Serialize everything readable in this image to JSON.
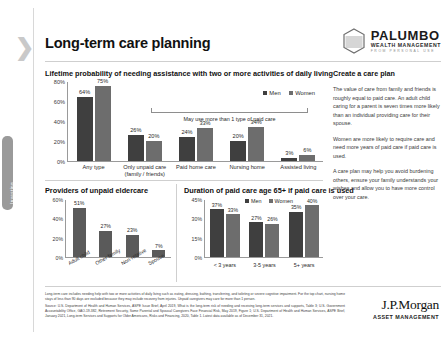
{
  "side_tab": {
    "label": "Investing"
  },
  "header": {
    "title": "Long-term care planning",
    "logo": {
      "name": "PALUMBO",
      "sub": "WEALTH MANAGEMENT",
      "tagline": "FROM PERSONAL USE"
    }
  },
  "top_chart_heading": "Lifetime probability of needing assistance with two or more activities of daily living",
  "bottom_left_heading": "Providers of unpaid eldercare",
  "bottom_right_heading": "Duration of paid care age 65+ if paid care is used",
  "brace_note": "May use more than 1 type of paid care",
  "legend": {
    "men": "Men",
    "women": "Women"
  },
  "sidebar": {
    "heading": "Create a care plan",
    "paragraphs": [
      "The value of care from family and friends is roughly equal to paid care. An adult child caring for a parent is seven times more likely than an individual providing care for their spouse.",
      "Women are more likely to require care and need more years of paid care if paid care is used.",
      "A care plan may help you avoid burdening others, ensure your family understands your wishes and allow you to have more control over your care."
    ]
  },
  "footnotes": [
    "Long-term care includes needing help with two or more activities of daily living such as eating, dressing, bathing, transferring, and toileting or severe cognitive impairment. For the top chart, nursing home stays of less than 90 days are excluded because they may include recovery from injuries. Unpaid caregivers may care for more than 1 person.",
    "Source: U.S. Department of Health and Human Services, ASPE Issue Brief, April 2019, What is the long-term risk of needing and receiving long-term services and supports, Table 3; U.S. Government Accountability Office, GAO-19-382, Retirement Security, Some Parental and Spousal Caregivers Face Financial Risk, May 2019, Figure 1; U.S. Department of Health and Human Services, ASPE Brief, January 2021, Long-term Services and Supports for Older Americans, Risks and Financing, 2020, Table 1. Latest data available as of December 31, 2021."
  ],
  "jpm_logo": {
    "name": "J.P.Morgan",
    "sub": "ASSET MANAGEMENT"
  },
  "chart_data": [
    {
      "type": "bar",
      "id": "lifetime-probability",
      "title": "Lifetime probability of needing assistance with two or more activities of daily living",
      "categories": [
        "Any type",
        "Only unpaid care (family / friends)",
        "Paid home care",
        "Nursing home",
        "Assisted living"
      ],
      "series": [
        {
          "name": "Men",
          "values": [
            64,
            26,
            24,
            20,
            3
          ]
        },
        {
          "name": "Women",
          "values": [
            75,
            20,
            33,
            34,
            6
          ]
        }
      ],
      "ytick_labels": [
        "0%",
        "20%",
        "40%",
        "60%",
        "80%"
      ],
      "ylim": [
        0,
        80
      ],
      "xlabel": "",
      "ylabel": "",
      "grid": false,
      "legend_position": "top-right",
      "annotation": "May use more than 1 type of paid care"
    },
    {
      "type": "bar",
      "id": "providers-unpaid-eldercare",
      "title": "Providers of unpaid eldercare",
      "categories": [
        "Adult child",
        "Other family",
        "Non-relative",
        "Spouse"
      ],
      "values": [
        51,
        27,
        23,
        7
      ],
      "ytick_labels": [
        "0%",
        "20%",
        "40%",
        "60%"
      ],
      "ylim": [
        0,
        60
      ],
      "xlabel": "",
      "ylabel": "",
      "grid": false
    },
    {
      "type": "bar",
      "id": "duration-paid-care",
      "title": "Duration of paid care age 65+ if paid care is used",
      "categories": [
        "< 3 years",
        "3-5 years",
        "5+ years"
      ],
      "series": [
        {
          "name": "Men",
          "values": [
            37,
            27,
            35
          ]
        },
        {
          "name": "Women",
          "values": [
            33,
            26,
            40
          ]
        }
      ],
      "ytick_labels": [
        "0%",
        "15%",
        "30%",
        "45%"
      ],
      "ylim": [
        0,
        45
      ],
      "xlabel": "",
      "ylabel": "",
      "grid": false,
      "legend_position": "top-center"
    }
  ]
}
